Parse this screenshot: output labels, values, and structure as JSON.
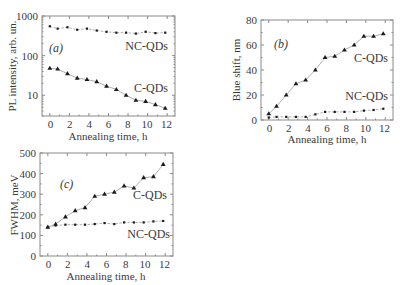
{
  "chart_data": [
    {
      "id": "a",
      "type": "line",
      "panel_label": "(a)",
      "xlabel": "Annealing time, h",
      "ylabel": "PL intensity, arb. un.",
      "yscale": "log",
      "xlim": [
        -0.8,
        12.8
      ],
      "ylim": [
        3,
        1000
      ],
      "xticks": [
        0,
        2,
        4,
        6,
        8,
        10,
        12
      ],
      "yticks": [
        10,
        100,
        1000
      ],
      "x": [
        0,
        0.8,
        1.8,
        2.8,
        3.8,
        4.8,
        5.8,
        6.8,
        7.8,
        8.8,
        9.8,
        10.8,
        11.8
      ],
      "series": [
        {
          "name": "NC-QDs",
          "marker": "circle",
          "values": [
            550,
            480,
            520,
            450,
            480,
            430,
            400,
            380,
            380,
            360,
            400,
            370,
            380
          ]
        },
        {
          "name": "C-QDs",
          "marker": "triangle",
          "values": [
            48,
            46,
            35,
            27,
            25,
            22,
            17,
            14,
            10,
            7.5,
            7,
            5.8,
            4.7
          ]
        }
      ]
    },
    {
      "id": "b",
      "type": "line",
      "panel_label": "(b)",
      "xlabel": "Annealing time, h",
      "ylabel": "Blue shift, nm",
      "yscale": "linear",
      "xlim": [
        -0.8,
        12.8
      ],
      "ylim": [
        0,
        80
      ],
      "xticks": [
        0,
        2,
        4,
        6,
        8,
        10,
        12
      ],
      "yticks": [
        0,
        20,
        40,
        60,
        80
      ],
      "x": [
        0,
        0.8,
        1.8,
        2.8,
        3.8,
        4.8,
        5.8,
        6.8,
        7.8,
        8.8,
        9.8,
        10.8,
        11.8
      ],
      "series": [
        {
          "name": "C-QDs",
          "marker": "triangle",
          "values": [
            5,
            11,
            20,
            29,
            32,
            40,
            50,
            51,
            56,
            60,
            67,
            67,
            69
          ]
        },
        {
          "name": "NC-QDs",
          "marker": "circle",
          "values": [
            2,
            2.5,
            2.5,
            2.5,
            2.5,
            4.5,
            6.5,
            6.5,
            6.5,
            6.5,
            7.5,
            8,
            9
          ]
        }
      ]
    },
    {
      "id": "c",
      "type": "line",
      "panel_label": "(c)",
      "xlabel": "Annealing time, h",
      "ylabel": "FWHM, meV",
      "yscale": "linear",
      "xlim": [
        -0.8,
        12.8
      ],
      "ylim": [
        0,
        500
      ],
      "xticks": [
        0,
        2,
        4,
        6,
        8,
        10,
        12
      ],
      "yticks": [
        0,
        100,
        200,
        300,
        400,
        500
      ],
      "x": [
        0,
        0.8,
        1.8,
        2.8,
        3.8,
        4.8,
        5.8,
        6.8,
        7.8,
        8.8,
        9.8,
        10.8,
        11.8
      ],
      "series": [
        {
          "name": "C-QDs",
          "marker": "triangle",
          "values": [
            140,
            155,
            190,
            220,
            235,
            290,
            300,
            310,
            340,
            330,
            380,
            385,
            445
          ]
        },
        {
          "name": "NC-QDs",
          "marker": "circle",
          "values": [
            140,
            148,
            152,
            152,
            152,
            155,
            160,
            155,
            163,
            163,
            163,
            168,
            170
          ]
        }
      ]
    }
  ],
  "labels": {
    "a": {
      "panel": "(a)",
      "ylabel": "PL intensity, arb. un.",
      "xlabel": "Annealing time, h",
      "s1": "NC-QDs",
      "s2": "C-QDs",
      "yt": [
        "1000",
        "100",
        "10"
      ],
      "xt": [
        "0",
        "2",
        "4",
        "6",
        "8",
        "10",
        "12"
      ]
    },
    "b": {
      "panel": "(b)",
      "ylabel": "Blue shift, nm",
      "xlabel": "Annealing time, h",
      "s1": "C-QDs",
      "s2": "NC-QDs",
      "yt": [
        "80",
        "60",
        "40",
        "20",
        "0"
      ],
      "xt": [
        "0",
        "2",
        "4",
        "6",
        "8",
        "10",
        "12"
      ]
    },
    "c": {
      "panel": "(c)",
      "ylabel": "FWHM, meV",
      "xlabel": "Annealing time, h",
      "s1": "C-QDs",
      "s2": "NC-QDs",
      "yt": [
        "500",
        "400",
        "300",
        "200",
        "100",
        "0"
      ],
      "xt": [
        "0",
        "2",
        "4",
        "6",
        "8",
        "10",
        "12"
      ]
    }
  }
}
